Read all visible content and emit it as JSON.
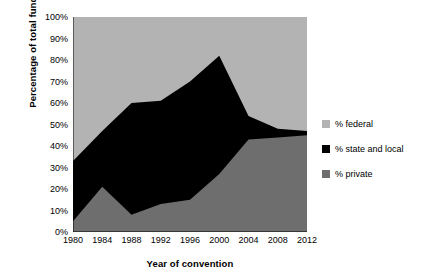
{
  "chart_data": {
    "type": "area",
    "stacked": true,
    "title": "",
    "xlabel": "Year of convention",
    "ylabel": "Percentage of total funds",
    "categories": [
      "1980",
      "1984",
      "1988",
      "1992",
      "1996",
      "2000",
      "2004",
      "2008",
      "2012"
    ],
    "x": [
      1980,
      1984,
      1988,
      1992,
      1996,
      2000,
      2004,
      2008,
      2012
    ],
    "xlim": [
      1980,
      2012
    ],
    "ylim": [
      0,
      100
    ],
    "grid": false,
    "legend_position": "right",
    "ytick_labels": [
      "0%",
      "10%",
      "20%",
      "30%",
      "40%",
      "50%",
      "60%",
      "70%",
      "80%",
      "90%",
      "100%"
    ],
    "ytick_values": [
      0,
      10,
      20,
      30,
      40,
      50,
      60,
      70,
      80,
      90,
      100
    ],
    "stack_order_bottom_to_top": [
      "% private",
      "% state and local",
      "% federal"
    ],
    "series": [
      {
        "name": "% private",
        "color": "#6e6e6e",
        "values": [
          5,
          21,
          8,
          13,
          15,
          27,
          43,
          44,
          45
        ]
      },
      {
        "name": "% state and local",
        "color": "#000000",
        "values": [
          28,
          26,
          52,
          48,
          55,
          55,
          11,
          4,
          2
        ]
      },
      {
        "name": "% federal",
        "color": "#b3b3b3",
        "values": [
          67,
          53,
          40,
          39,
          30,
          18,
          46,
          52,
          53
        ]
      }
    ],
    "cumulative_upper_boundaries": {
      "private_top": [
        5,
        21,
        8,
        13,
        15,
        27,
        43,
        44,
        45
      ],
      "state_and_local_top": [
        33,
        47,
        60,
        61,
        70,
        82,
        54,
        48,
        47
      ]
    }
  },
  "legend": {
    "items": [
      {
        "label": "% federal",
        "color": "#b3b3b3"
      },
      {
        "label": "% state and local",
        "color": "#000000"
      },
      {
        "label": "% private",
        "color": "#6e6e6e"
      }
    ]
  },
  "axes": {
    "y_title": "Percentage of total funds",
    "x_title": "Year of convention"
  }
}
